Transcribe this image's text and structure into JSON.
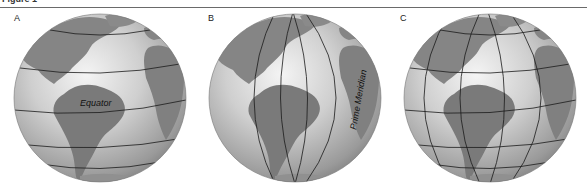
{
  "figure": {
    "title": "Figure 1",
    "rule_color": "#6a6a6a"
  },
  "panels": [
    {
      "label": "A",
      "lines": "latitude",
      "annotation": "Equator"
    },
    {
      "label": "B",
      "lines": "longitude",
      "annotation": "Prime Meridian",
      "annotation_words": [
        "Prime",
        "Meridian"
      ]
    },
    {
      "label": "C",
      "lines": "latitude+longitude",
      "annotation": ""
    }
  ],
  "colors": {
    "ocean_light": "#e6e6e6",
    "ocean_dark": "#8a8a8a",
    "land": "#7d7d7d",
    "grid_line": "#1a1a1a"
  }
}
